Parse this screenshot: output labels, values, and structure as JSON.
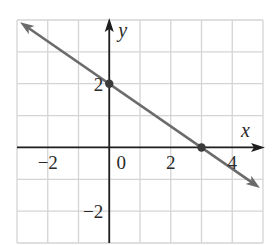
{
  "chart_data": {
    "type": "line",
    "title": "",
    "xlabel": "x",
    "ylabel": "y",
    "xlim": [
      -3,
      5
    ],
    "ylim": [
      -3,
      4
    ],
    "grid": true,
    "x_ticks": [
      {
        "value": -2,
        "label": "−2"
      },
      {
        "value": 0,
        "label": "0"
      },
      {
        "value": 2,
        "label": "2"
      },
      {
        "value": 4,
        "label": "4"
      }
    ],
    "y_ticks": [
      {
        "value": 2,
        "label": "2"
      },
      {
        "value": -2,
        "label": "−2"
      }
    ],
    "series": [
      {
        "name": "line",
        "equation": "y = -2/3 x + 2",
        "x": [
          -2.9,
          4.9
        ],
        "y": [
          3.93,
          -1.27
        ],
        "color": "#6b6b6b",
        "arrows": "both"
      }
    ],
    "points": [
      {
        "x": 0,
        "y": 2,
        "label": "y-intercept"
      },
      {
        "x": 3,
        "y": 0,
        "label": "x-intercept"
      }
    ]
  },
  "colors": {
    "grid": "#d4d4d4",
    "axis": "#1e1e1e",
    "line": "#6b6b6b",
    "point": "#3a3a3a"
  }
}
